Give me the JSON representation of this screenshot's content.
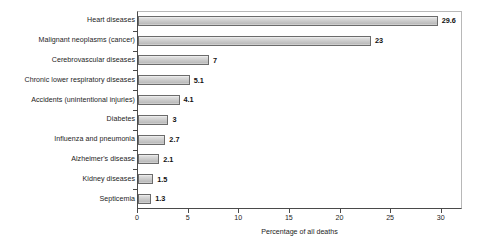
{
  "chart_data": {
    "type": "bar",
    "orientation": "horizontal",
    "title": "",
    "xlabel": "Percentage of all deaths",
    "ylabel": "",
    "xlim": [
      0,
      32
    ],
    "xticks": [
      0,
      5,
      10,
      15,
      20,
      25,
      30
    ],
    "xtick_labels": [
      "0",
      "5",
      "10",
      "15",
      "20",
      "25",
      "30"
    ],
    "grid": false,
    "legend": null,
    "categories": [
      "Heart diseases",
      "Malignant neoplasms (cancer)",
      "Cerebrovascular diseases",
      "Chronic lower respiratory diseases",
      "Accidents (unintentional injuries)",
      "Diabetes",
      "Influenza and pneumonia",
      "Alzheimer's disease",
      "Kidney diseases",
      "Septicemia"
    ],
    "values": [
      29.6,
      23,
      7,
      5.1,
      4.1,
      3,
      2.7,
      2.1,
      1.5,
      1.3
    ],
    "value_labels": [
      "29.6",
      "23",
      "7",
      "5.1",
      "4.1",
      "3",
      "2.7",
      "2.1",
      "1.5",
      "1.3"
    ],
    "bar_fill_color": "#c9c9c9",
    "bar_border_color": "#6b6b6b",
    "axis_color": "#4a4a4a",
    "text_color": "#1c1c1c",
    "background_color": "#ffffff"
  }
}
